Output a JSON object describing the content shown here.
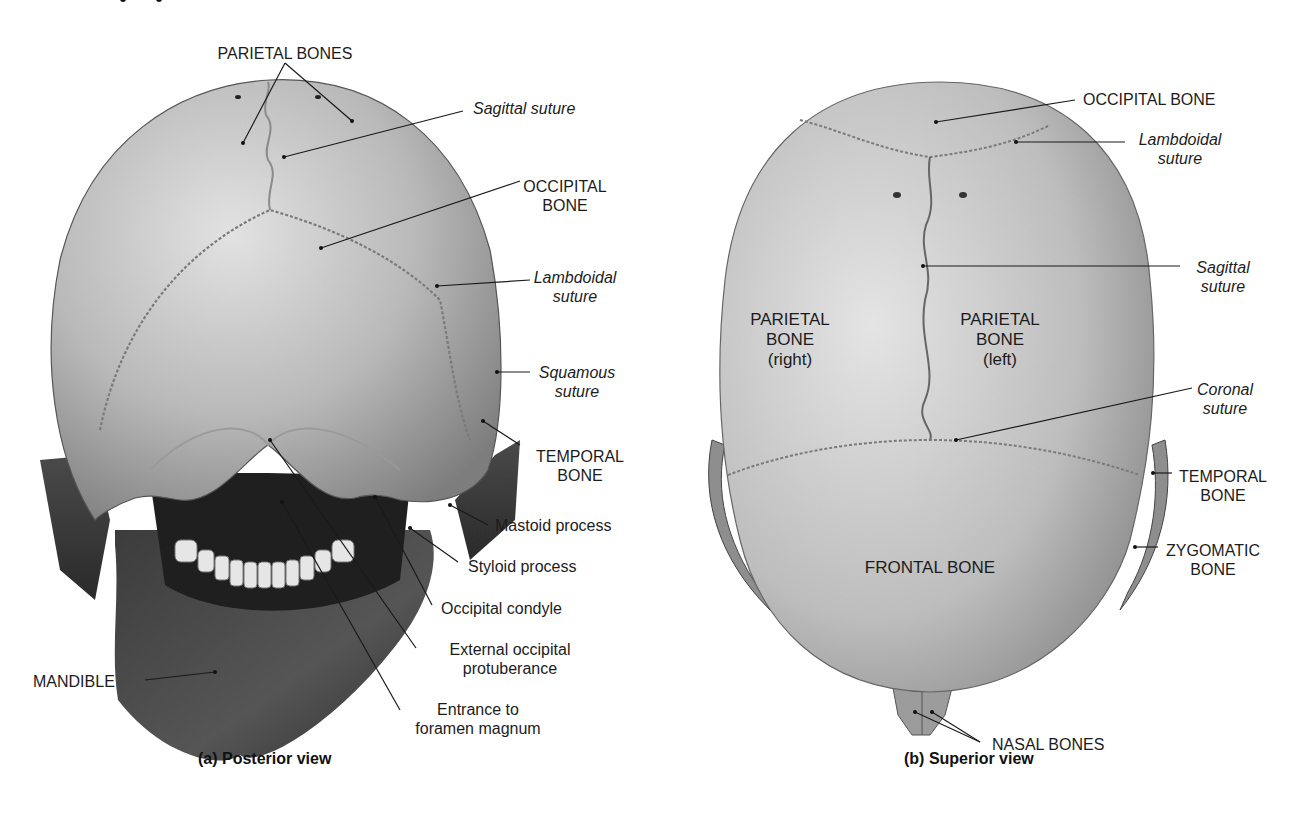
{
  "colors": {
    "background": "#ffffff",
    "text": "#1c1c1c",
    "leader_line": "#1a1a1a",
    "bone_light": "#d4d4d4",
    "bone_mid": "#a9a9a9",
    "bone_dark": "#3a3a3a",
    "suture": "#8a8a8a"
  },
  "posterior": {
    "caption": "(a) Posterior view",
    "labels": {
      "parietal_bones": "PARIETAL BONES",
      "sagittal_suture": "Sagittal suture",
      "occipital_bone_l1": "OCCIPITAL",
      "occipital_bone_l2": "BONE",
      "lambdoidal_l1": "Lambdoidal",
      "lambdoidal_l2": "suture",
      "squamous_l1": "Squamous",
      "squamous_l2": "suture",
      "temporal_l1": "TEMPORAL",
      "temporal_l2": "BONE",
      "mastoid": "Mastoid process",
      "styloid": "Styloid process",
      "occipital_condyle": "Occipital condyle",
      "ext_occ_l1": "External occipital",
      "ext_occ_l2": "protuberance",
      "foramen_l1": "Entrance to",
      "foramen_l2": "foramen magnum",
      "mandible": "MANDIBLE"
    }
  },
  "superior": {
    "caption": "(b) Superior view",
    "labels": {
      "occipital_bone": "OCCIPITAL BONE",
      "lambdoidal_l1": "Lambdoidal",
      "lambdoidal_l2": "suture",
      "sagittal_l1": "Sagittal",
      "sagittal_l2": "suture",
      "parietal_right_l1": "PARIETAL",
      "parietal_right_l2": "BONE",
      "parietal_right_l3": "(right)",
      "parietal_left_l1": "PARIETAL",
      "parietal_left_l2": "BONE",
      "parietal_left_l3": "(left)",
      "coronal_l1": "Coronal",
      "coronal_l2": "suture",
      "temporal_l1": "TEMPORAL",
      "temporal_l2": "BONE",
      "zygomatic_l1": "ZYGOMATIC",
      "zygomatic_l2": "BONE",
      "frontal_bone": "FRONTAL BONE",
      "nasal_bones": "NASAL BONES"
    }
  }
}
